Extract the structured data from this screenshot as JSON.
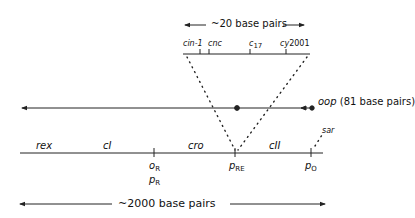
{
  "diagram": {
    "top_scale": {
      "label": "~20 base pairs"
    },
    "detail_sites": [
      {
        "name": "cin-1",
        "x": 191
      },
      {
        "name": "cnc",
        "x": 208
      },
      {
        "name": "c",
        "sub": "17",
        "x": 251
      },
      {
        "name": "cy",
        "suffix": "2001",
        "x": 283
      }
    ],
    "oop": {
      "label": "oop",
      "note": "(81 base pairs)"
    },
    "genes": [
      "rex",
      "cI",
      "cro",
      "cII"
    ],
    "sar": "sar",
    "sites": [
      {
        "main": "o",
        "sub": "R"
      },
      {
        "main": "p",
        "sub": "R"
      },
      {
        "main": "p",
        "sub": "RE"
      },
      {
        "main": "p",
        "sub": "O"
      }
    ],
    "bottom_scale": {
      "label": "~2000 base pairs"
    },
    "colors": {
      "line": "#222222",
      "background": "#ffffff"
    }
  }
}
